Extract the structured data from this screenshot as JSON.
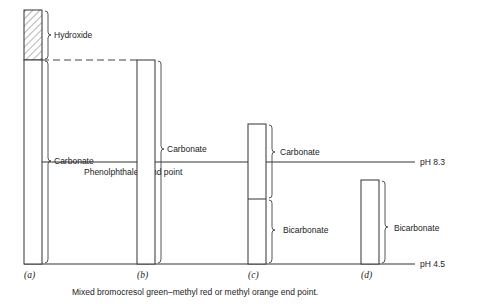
{
  "diagram": {
    "columns": [
      {
        "id": "a",
        "label": "(a)",
        "segments": [
          {
            "name": "Hydroxide",
            "hatched": true
          },
          {
            "name": "Carbonate",
            "hatched": false
          }
        ]
      },
      {
        "id": "b",
        "label": "(b)",
        "segments": [
          {
            "name": "Carbonate",
            "hatched": false
          }
        ]
      },
      {
        "id": "c",
        "label": "(c)",
        "segments": [
          {
            "name": "Carbonate",
            "hatched": false
          },
          {
            "name": "Bicarbonate",
            "hatched": false
          }
        ]
      },
      {
        "id": "d",
        "label": "(d)",
        "segments": [
          {
            "name": "Bicarbonate",
            "hatched": false
          }
        ]
      }
    ],
    "reference_lines": {
      "ph83": {
        "label": "pH  8.3",
        "caption": "Phenolphthalein  end  point"
      },
      "ph45": {
        "label": "pH  4.5",
        "caption": "Mixed bromocresol green–methyl red or methyl orange end point."
      }
    }
  }
}
